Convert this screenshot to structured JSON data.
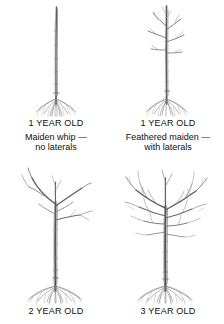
{
  "figure": {
    "background_color": "#ffffff",
    "ink_color": "#4a4a4a",
    "text_color": "#111111"
  },
  "panels": [
    {
      "id": "one-year-maiden-whip",
      "illustration_name": "tree-1-year-maiden-whip",
      "age_label": "1 YEAR OLD",
      "description_lines": [
        "Maiden whip —",
        "no laterals"
      ]
    },
    {
      "id": "one-year-feathered-maiden",
      "illustration_name": "tree-1-year-feathered-maiden",
      "age_label": "1 YEAR OLD",
      "description_lines": [
        "Feathered maiden —",
        "with laterals"
      ]
    },
    {
      "id": "two-year-old",
      "illustration_name": "tree-2-year-old",
      "age_label": "2 YEAR OLD",
      "description_lines": []
    },
    {
      "id": "three-year-old",
      "illustration_name": "tree-3-year-old",
      "age_label": "3 YEAR OLD",
      "description_lines": []
    }
  ]
}
